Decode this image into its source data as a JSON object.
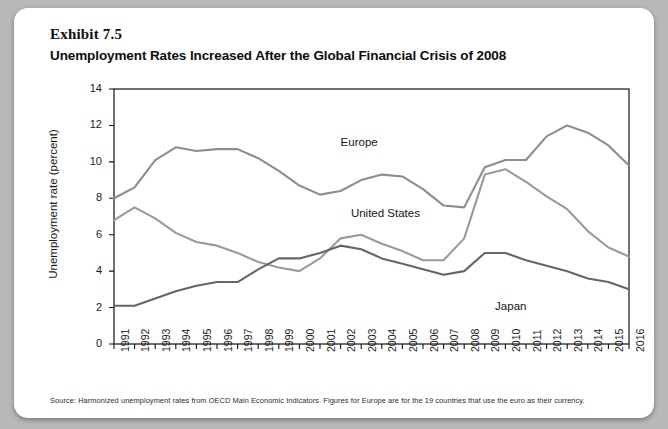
{
  "exhibit": {
    "number_label": "Exhibit 7.5",
    "title": "Unemployment Rates Increased After the Global Financial Crisis of 2008"
  },
  "source": {
    "note": "Source: Harmonized unemployment rates from OECD Main Economic Indicators.  Figures for Europe are for the 19 countries that use the euro as their currency."
  },
  "colors": {
    "card_background": "#ffffff",
    "page_background": "#b8b8b8",
    "axis": "#111111",
    "europe_line": "#8d8d8d",
    "united_states_line": "#9a9a9a",
    "japan_line": "#666666",
    "text": "#111111"
  },
  "chart_data": {
    "type": "line",
    "title": "Unemployment Rates Increased After the Global Financial Crisis of 2008",
    "xlabel": "",
    "ylabel": "Unemployment rate (percent)",
    "ylim": [
      0,
      14
    ],
    "yticks": [
      0,
      2,
      4,
      6,
      8,
      10,
      12,
      14
    ],
    "grid": false,
    "legend": "inline-annotations",
    "x": [
      1991,
      1992,
      1993,
      1994,
      1995,
      1996,
      1997,
      1998,
      1999,
      2000,
      2001,
      2002,
      2003,
      2004,
      2005,
      2006,
      2007,
      2008,
      2009,
      2010,
      2011,
      2012,
      2013,
      2014,
      2015,
      2016
    ],
    "xtick_labels": [
      "1991",
      "1992",
      "1993",
      "1994",
      "1995",
      "1996",
      "1997",
      "1998",
      "1999",
      "2000",
      "2001",
      "2002",
      "2003",
      "2004",
      "2005",
      "2006",
      "2007",
      "2008",
      "2009",
      "2010",
      "2011",
      "2012",
      "2013",
      "2014",
      "2015",
      "2016"
    ],
    "series": [
      {
        "name": "Europe",
        "color": "#8d8d8d",
        "values": [
          8.0,
          8.6,
          10.1,
          10.8,
          10.6,
          10.7,
          10.7,
          10.2,
          9.5,
          8.7,
          8.2,
          8.4,
          9.0,
          9.3,
          9.2,
          8.5,
          7.6,
          7.5,
          9.7,
          10.1,
          10.1,
          11.4,
          12.0,
          11.6,
          10.9,
          9.8
        ]
      },
      {
        "name": "United States",
        "color": "#9a9a9a",
        "values": [
          6.8,
          7.5,
          6.9,
          6.1,
          5.6,
          5.4,
          5.0,
          4.5,
          4.2,
          4.0,
          4.7,
          5.8,
          6.0,
          5.5,
          5.1,
          4.6,
          4.6,
          5.8,
          9.3,
          9.6,
          8.9,
          8.1,
          7.4,
          6.2,
          5.3,
          4.8
        ]
      },
      {
        "name": "Japan",
        "color": "#666666",
        "values": [
          2.1,
          2.1,
          2.5,
          2.9,
          3.2,
          3.4,
          3.4,
          4.1,
          4.7,
          4.7,
          5.0,
          5.4,
          5.2,
          4.7,
          4.4,
          4.1,
          3.8,
          4.0,
          5.0,
          5.0,
          4.6,
          4.3,
          4.0,
          3.6,
          3.4,
          3.0
        ]
      }
    ],
    "annotations": [
      {
        "text": "Europe",
        "x": 2002,
        "y": 11.0
      },
      {
        "text": "United States",
        "x": 2002.5,
        "y": 7.1
      },
      {
        "text": "Japan",
        "x": 2009.5,
        "y": 1.95
      }
    ]
  }
}
